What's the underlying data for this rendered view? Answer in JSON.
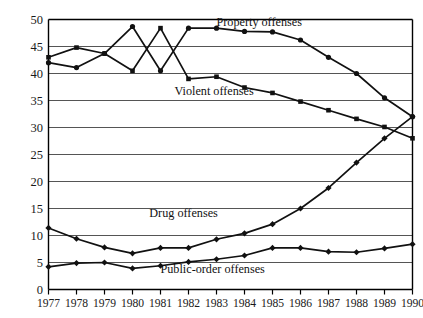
{
  "chart_data": {
    "type": "line",
    "title": "",
    "subtitle": "",
    "xlabel": "",
    "ylabel": "",
    "grid": true,
    "legend_position": "inline-annotations",
    "xlim": [
      1977,
      1990
    ],
    "ylim": [
      0,
      50
    ],
    "ytick_step": 5,
    "categories": [
      1977,
      1978,
      1979,
      1980,
      1981,
      1982,
      1983,
      1984,
      1985,
      1986,
      1987,
      1988,
      1989,
      1990
    ],
    "xtick_labels": [
      "1977",
      "1978",
      "1979",
      "1980",
      "1981",
      "1982",
      "1983",
      "1984",
      "1985",
      "1986",
      "1987",
      "1988",
      "1989",
      "1990"
    ],
    "ytick_labels": [
      "0",
      "5",
      "10",
      "15",
      "20",
      "25",
      "30",
      "35",
      "40",
      "45",
      "50"
    ],
    "ytick_values": [
      0,
      5,
      10,
      15,
      20,
      25,
      30,
      35,
      40,
      45,
      50
    ],
    "series": [
      {
        "name": "Property offenses",
        "label": "Property offenses",
        "color": "#111111",
        "marker": "circle",
        "values": [
          42.0,
          41.1,
          43.7,
          48.7,
          40.5,
          48.4,
          48.4,
          47.8,
          47.7,
          46.2,
          43.0,
          40.0,
          35.5,
          32.0
        ]
      },
      {
        "name": "Violent offenses",
        "label": "Violent offenses",
        "color": "#111111",
        "marker": "square",
        "values": [
          43.0,
          44.8,
          43.7,
          40.5,
          48.4,
          39.0,
          39.4,
          37.4,
          36.4,
          34.8,
          33.2,
          31.6,
          30.1,
          28.0
        ]
      },
      {
        "name": "Drug offenses",
        "label": "Drug offenses",
        "color": "#111111",
        "marker": "diamond",
        "values": [
          11.4,
          9.4,
          7.8,
          6.7,
          7.7,
          7.7,
          9.3,
          10.4,
          12.1,
          15.0,
          18.8,
          23.5,
          28.0,
          32.0
        ]
      },
      {
        "name": "Public-order offenses",
        "label": "Public-order offenses",
        "color": "#111111",
        "marker": "diamond",
        "values": [
          4.2,
          4.9,
          5.0,
          3.9,
          4.4,
          5.1,
          5.6,
          6.3,
          7.7,
          7.7,
          7.0,
          6.9,
          7.6,
          8.4
        ]
      }
    ],
    "annotations": [
      {
        "text": "Property offenses",
        "x": 1983.0,
        "y": 48.8,
        "anchor": "start"
      },
      {
        "text": "Violent offenses",
        "x": 1981.5,
        "y": 36.0,
        "anchor": "start"
      },
      {
        "text": "Drug offenses",
        "x": 1980.6,
        "y": 13.4,
        "anchor": "start"
      },
      {
        "text": "Public-order offenses",
        "x": 1981.0,
        "y": 3.0,
        "anchor": "start"
      }
    ]
  },
  "colors": {
    "axis": "#000000",
    "grid": "#555555",
    "line": "#111111",
    "text": "#1a1a1a",
    "background": "#ffffff"
  }
}
